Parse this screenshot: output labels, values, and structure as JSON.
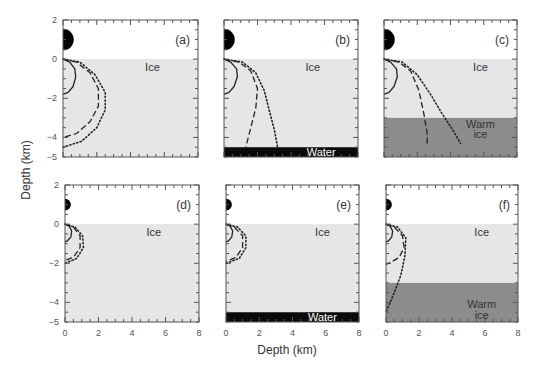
{
  "chart_data": {
    "type": "line",
    "title": "",
    "xlabel": "Depth (km)",
    "ylabel": "Depth (km)",
    "xlim": [
      0,
      8
    ],
    "ylim": [
      -5,
      2
    ],
    "x_ticks": [
      0,
      2,
      4,
      6,
      8
    ],
    "y_ticks": [
      2,
      0,
      -2,
      -4,
      -5
    ],
    "grid": false,
    "legend": null,
    "colors": {
      "ice": "#e6e6e6",
      "warm_ice": "#8c8c8c",
      "water": "#0a0a0a",
      "impactor": "#000000",
      "frame": "#555555",
      "curve": "#222222"
    },
    "panels": [
      {
        "id": "a",
        "label": "(a)",
        "impactor_radius_km": 0.55,
        "layers": [
          {
            "name": "Ice",
            "from": 0,
            "to": -5,
            "color": "ice"
          }
        ],
        "region_labels": [
          {
            "text": "Ice",
            "x": 5.3,
            "y": -0.4
          }
        ],
        "series": [
          {
            "name": "solid",
            "style": "solid",
            "points": [
              [
                0,
                0
              ],
              [
                0.4,
                -0.15
              ],
              [
                0.7,
                -0.5
              ],
              [
                0.75,
                -0.9
              ],
              [
                0.6,
                -1.4
              ],
              [
                0.3,
                -1.7
              ],
              [
                0,
                -1.8
              ]
            ]
          },
          {
            "name": "dashed",
            "style": "dashed",
            "points": [
              [
                0,
                0
              ],
              [
                0.8,
                -0.15
              ],
              [
                1.6,
                -0.7
              ],
              [
                2.1,
                -1.5
              ],
              [
                2.1,
                -2.4
              ],
              [
                1.6,
                -3.2
              ],
              [
                0.8,
                -3.8
              ],
              [
                0,
                -4.0
              ]
            ]
          },
          {
            "name": "dotted",
            "style": "dotted",
            "points": [
              [
                0,
                0
              ],
              [
                1.0,
                -0.15
              ],
              [
                1.9,
                -0.8
              ],
              [
                2.5,
                -1.7
              ],
              [
                2.5,
                -2.6
              ],
              [
                2.0,
                -3.5
              ],
              [
                1.1,
                -4.2
              ],
              [
                0,
                -4.5
              ]
            ]
          }
        ]
      },
      {
        "id": "b",
        "label": "(b)",
        "impactor_radius_km": 0.55,
        "layers": [
          {
            "name": "Ice",
            "from": 0,
            "to": -4.5,
            "color": "ice"
          },
          {
            "name": "Water",
            "from": -4.5,
            "to": -5,
            "color": "water"
          }
        ],
        "region_labels": [
          {
            "text": "Ice",
            "x": 5.3,
            "y": -0.4
          },
          {
            "text": "Water",
            "x": 5.8,
            "y": -4.75,
            "light": true
          }
        ],
        "series": [
          {
            "name": "solid",
            "style": "solid",
            "points": [
              [
                0,
                0
              ],
              [
                0.4,
                -0.15
              ],
              [
                0.75,
                -0.5
              ],
              [
                0.8,
                -0.9
              ],
              [
                0.6,
                -1.4
              ],
              [
                0.3,
                -1.7
              ],
              [
                0,
                -1.8
              ]
            ]
          },
          {
            "name": "dashed",
            "style": "dashed",
            "points": [
              [
                0,
                0
              ],
              [
                0.9,
                -0.15
              ],
              [
                1.6,
                -0.6
              ],
              [
                2.0,
                -1.5
              ],
              [
                1.9,
                -2.5
              ],
              [
                1.6,
                -3.5
              ],
              [
                1.3,
                -4.5
              ]
            ]
          },
          {
            "name": "dotted",
            "style": "dotted",
            "points": [
              [
                0,
                0
              ],
              [
                1.1,
                -0.15
              ],
              [
                1.9,
                -0.7
              ],
              [
                2.4,
                -1.6
              ],
              [
                2.7,
                -2.6
              ],
              [
                3.0,
                -3.6
              ],
              [
                3.2,
                -4.5
              ]
            ]
          }
        ]
      },
      {
        "id": "c",
        "label": "(c)",
        "impactor_radius_km": 0.55,
        "layers": [
          {
            "name": "Ice",
            "from": 0,
            "to": -3,
            "color": "ice"
          },
          {
            "name": "Warm ice",
            "from": -3,
            "to": -5,
            "color": "warm_ice"
          }
        ],
        "region_labels": [
          {
            "text": "Ice",
            "x": 5.8,
            "y": -0.4
          },
          {
            "text": "Warm",
            "x": 5.8,
            "y": -3.3
          },
          {
            "text": "ice",
            "x": 5.8,
            "y": -3.85
          }
        ],
        "series": [
          {
            "name": "solid",
            "style": "solid",
            "points": [
              [
                0,
                0
              ],
              [
                0.4,
                -0.15
              ],
              [
                0.75,
                -0.5
              ],
              [
                0.8,
                -0.9
              ],
              [
                0.6,
                -1.4
              ],
              [
                0.3,
                -1.7
              ],
              [
                0,
                -1.8
              ]
            ]
          },
          {
            "name": "dashed",
            "style": "dashed",
            "points": [
              [
                0,
                0
              ],
              [
                0.9,
                -0.15
              ],
              [
                1.6,
                -0.6
              ],
              [
                2.1,
                -1.6
              ],
              [
                2.4,
                -2.8
              ],
              [
                2.6,
                -3.8
              ],
              [
                2.6,
                -4.4
              ]
            ]
          },
          {
            "name": "dotted",
            "style": "dotted",
            "points": [
              [
                0,
                0
              ],
              [
                1.1,
                -0.15
              ],
              [
                2.0,
                -0.8
              ],
              [
                2.8,
                -1.8
              ],
              [
                3.5,
                -2.8
              ],
              [
                4.2,
                -3.7
              ],
              [
                4.6,
                -4.3
              ]
            ]
          }
        ]
      },
      {
        "id": "d",
        "label": "(d)",
        "impactor_radius_km": 0.3,
        "layers": [
          {
            "name": "Ice",
            "from": 0,
            "to": -5,
            "color": "ice"
          }
        ],
        "region_labels": [
          {
            "text": "Ice",
            "x": 5.3,
            "y": -0.4
          }
        ],
        "series": [
          {
            "name": "solid",
            "style": "solid",
            "points": [
              [
                0,
                0
              ],
              [
                0.25,
                -0.1
              ],
              [
                0.4,
                -0.35
              ],
              [
                0.35,
                -0.65
              ],
              [
                0.15,
                -0.85
              ],
              [
                0,
                -0.9
              ]
            ]
          },
          {
            "name": "dashed",
            "style": "dashed",
            "points": [
              [
                0,
                0
              ],
              [
                0.5,
                -0.15
              ],
              [
                0.9,
                -0.6
              ],
              [
                0.9,
                -1.2
              ],
              [
                0.5,
                -1.7
              ],
              [
                0,
                -1.85
              ]
            ]
          },
          {
            "name": "dotted",
            "style": "dotted",
            "points": [
              [
                0,
                0
              ],
              [
                0.6,
                -0.15
              ],
              [
                1.05,
                -0.6
              ],
              [
                1.1,
                -1.2
              ],
              [
                0.7,
                -1.75
              ],
              [
                0,
                -2.0
              ]
            ]
          }
        ]
      },
      {
        "id": "e",
        "label": "(e)",
        "impactor_radius_km": 0.3,
        "layers": [
          {
            "name": "Ice",
            "from": 0,
            "to": -4.5,
            "color": "ice"
          },
          {
            "name": "Water",
            "from": -4.5,
            "to": -5,
            "color": "water"
          }
        ],
        "region_labels": [
          {
            "text": "Ice",
            "x": 5.8,
            "y": -0.4
          },
          {
            "text": "Water",
            "x": 5.8,
            "y": -4.75,
            "light": true
          }
        ],
        "series": [
          {
            "name": "solid",
            "style": "solid",
            "points": [
              [
                0,
                0
              ],
              [
                0.25,
                -0.1
              ],
              [
                0.4,
                -0.35
              ],
              [
                0.35,
                -0.65
              ],
              [
                0.15,
                -0.85
              ],
              [
                0,
                -0.9
              ]
            ]
          },
          {
            "name": "dashed",
            "style": "dashed",
            "points": [
              [
                0,
                0
              ],
              [
                0.5,
                -0.15
              ],
              [
                1.0,
                -0.6
              ],
              [
                1.0,
                -1.2
              ],
              [
                0.6,
                -1.7
              ],
              [
                0,
                -1.9
              ]
            ]
          },
          {
            "name": "dotted",
            "style": "dotted",
            "points": [
              [
                0,
                0
              ],
              [
                0.7,
                -0.15
              ],
              [
                1.2,
                -0.6
              ],
              [
                1.2,
                -1.2
              ],
              [
                0.8,
                -1.75
              ],
              [
                0,
                -2.0
              ]
            ]
          }
        ]
      },
      {
        "id": "f",
        "label": "(f)",
        "impactor_radius_km": 0.3,
        "layers": [
          {
            "name": "Ice",
            "from": 0,
            "to": -3,
            "color": "ice"
          },
          {
            "name": "Warm ice",
            "from": -3,
            "to": -5,
            "color": "warm_ice"
          }
        ],
        "region_labels": [
          {
            "text": "Ice",
            "x": 5.8,
            "y": -0.4
          },
          {
            "text": "Warm",
            "x": 5.8,
            "y": -4.1
          },
          {
            "text": "ice",
            "x": 5.8,
            "y": -4.65
          }
        ],
        "series": [
          {
            "name": "solid",
            "style": "solid",
            "points": [
              [
                0,
                0
              ],
              [
                0.25,
                -0.1
              ],
              [
                0.4,
                -0.35
              ],
              [
                0.35,
                -0.65
              ],
              [
                0.15,
                -0.85
              ],
              [
                0,
                -0.9
              ]
            ]
          },
          {
            "name": "dashed",
            "style": "dashed",
            "points": [
              [
                0,
                0
              ],
              [
                0.5,
                -0.15
              ],
              [
                1.0,
                -0.6
              ],
              [
                1.1,
                -1.2
              ],
              [
                0.8,
                -1.7
              ],
              [
                0.3,
                -1.95
              ],
              [
                0,
                -2.05
              ]
            ]
          },
          {
            "name": "dotted",
            "style": "dotted",
            "points": [
              [
                0,
                0
              ],
              [
                0.7,
                -0.15
              ],
              [
                1.2,
                -0.7
              ],
              [
                1.15,
                -1.6
              ],
              [
                0.9,
                -2.6
              ],
              [
                0.5,
                -3.5
              ],
              [
                0.1,
                -4.3
              ],
              [
                0,
                -4.5
              ]
            ]
          }
        ]
      }
    ]
  },
  "layout": {
    "panels": [
      {
        "id": "a",
        "x": 63,
        "y": 20,
        "w": 135,
        "h": 137
      },
      {
        "id": "b",
        "x": 224,
        "y": 20,
        "w": 134,
        "h": 137
      },
      {
        "id": "c",
        "x": 384,
        "y": 20,
        "w": 133,
        "h": 137
      },
      {
        "id": "d",
        "x": 65,
        "y": 185,
        "w": 134,
        "h": 137
      },
      {
        "id": "e",
        "x": 226,
        "y": 185,
        "w": 133,
        "h": 137
      },
      {
        "id": "f",
        "x": 386,
        "y": 185,
        "w": 132,
        "h": 137
      }
    ],
    "ylabel_pos": {
      "x": 30,
      "y": 170
    },
    "xlabel_pos": {
      "x": 287,
      "y": 354
    }
  }
}
